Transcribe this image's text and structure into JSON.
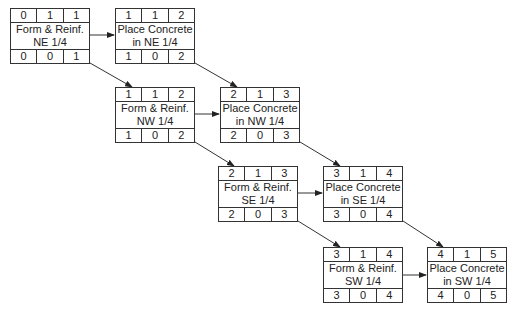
{
  "nodes": [
    {
      "id": "A",
      "line1": "Form & Reinf.",
      "line2": "NE 1/4",
      "top": [
        "0",
        "1",
        "1"
      ],
      "bottom": [
        "0",
        "0",
        "1"
      ],
      "x": 10,
      "y": 8
    },
    {
      "id": "B",
      "line1": "Place Concrete",
      "line2": "in NE 1/4",
      "top": [
        "1",
        "1",
        "2"
      ],
      "bottom": [
        "1",
        "0",
        "2"
      ],
      "x": 115,
      "y": 8
    },
    {
      "id": "C",
      "line1": "Form & Reinf.",
      "line2": "NW 1/4",
      "top": [
        "1",
        "1",
        "2"
      ],
      "bottom": [
        "1",
        "0",
        "2"
      ],
      "x": 115,
      "y": 87
    },
    {
      "id": "D",
      "line1": "Place Concrete",
      "line2": "in NW 1/4",
      "top": [
        "2",
        "1",
        "3"
      ],
      "bottom": [
        "2",
        "0",
        "3"
      ],
      "x": 220,
      "y": 87
    },
    {
      "id": "E",
      "line1": "Form & Reinf.",
      "line2": "SE 1/4",
      "top": [
        "2",
        "1",
        "3"
      ],
      "bottom": [
        "2",
        "0",
        "3"
      ],
      "x": 218,
      "y": 166
    },
    {
      "id": "F",
      "line1": "Place Concrete",
      "line2": "in SE 1/4",
      "top": [
        "3",
        "1",
        "4"
      ],
      "bottom": [
        "3",
        "0",
        "4"
      ],
      "x": 323,
      "y": 166
    },
    {
      "id": "G",
      "line1": "Form & Reinf.",
      "line2": "SW 1/4",
      "top": [
        "3",
        "1",
        "4"
      ],
      "bottom": [
        "3",
        "0",
        "4"
      ],
      "x": 323,
      "y": 247
    },
    {
      "id": "H",
      "line1": "Place Concrete",
      "line2": "in SW 1/4",
      "top": [
        "4",
        "1",
        "5"
      ],
      "bottom": [
        "4",
        "0",
        "5"
      ],
      "x": 427,
      "y": 247
    }
  ],
  "edges": [
    [
      "A",
      "B"
    ],
    [
      "A",
      "C"
    ],
    [
      "B",
      "D"
    ],
    [
      "C",
      "D"
    ],
    [
      "C",
      "E"
    ],
    [
      "D",
      "F"
    ],
    [
      "E",
      "F"
    ],
    [
      "E",
      "G"
    ],
    [
      "F",
      "H"
    ],
    [
      "G",
      "H"
    ]
  ]
}
